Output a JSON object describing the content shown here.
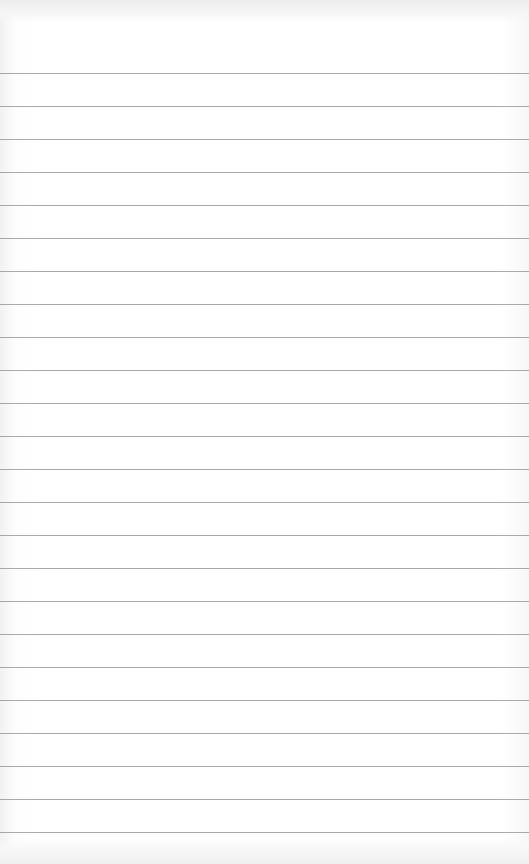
{
  "page": {
    "type": "ruled-notepad-page",
    "background_color": "#ffffff",
    "rule_color": "#8e8e8e",
    "rule_count": 24,
    "first_rule_y": 73,
    "rule_spacing": 33,
    "text": ""
  }
}
